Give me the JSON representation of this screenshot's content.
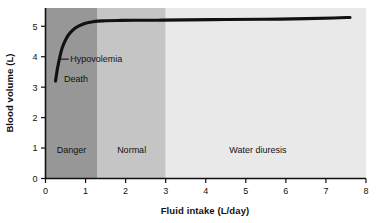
{
  "chart_data": {
    "type": "line",
    "title": "",
    "xlabel": "Fluid intake (L/day)",
    "ylabel": "Blood volume (L)",
    "xlim": [
      0,
      8
    ],
    "ylim": [
      0,
      5.6
    ],
    "grid": false,
    "legend": "none",
    "xticks": [
      "0",
      "1",
      "2",
      "3",
      "4",
      "5",
      "6",
      "7",
      "8"
    ],
    "xtick_values": [
      0,
      1,
      2,
      3,
      4,
      5,
      6,
      7,
      8
    ],
    "yticks": [
      "0",
      "1",
      "2",
      "3",
      "4",
      "5"
    ],
    "ytick_values": [
      0,
      1,
      2,
      3,
      4,
      5
    ],
    "series": [
      {
        "name": "Blood volume",
        "color": "#111111",
        "x": [
          0.25,
          0.3,
          0.36,
          0.42,
          0.5,
          0.6,
          0.72,
          0.85,
          1.0,
          1.15,
          1.3,
          1.5,
          1.8,
          2.2,
          2.8,
          3.5,
          4.5,
          5.5,
          6.5,
          7.2,
          7.6
        ],
        "y": [
          3.2,
          3.62,
          4.0,
          4.3,
          4.55,
          4.76,
          4.92,
          5.02,
          5.1,
          5.14,
          5.17,
          5.18,
          5.19,
          5.2,
          5.2,
          5.21,
          5.22,
          5.23,
          5.25,
          5.27,
          5.29
        ]
      }
    ],
    "bands": [
      {
        "label": "Danger",
        "x_start": 0.0,
        "x_end": 1.3,
        "color": "#979797",
        "label_x": 0.65,
        "label_y": 0.85
      },
      {
        "label": "Normal",
        "x_start": 1.3,
        "x_end": 3.0,
        "color": "#c5c5c5",
        "label_x": 2.15,
        "label_y": 0.85
      },
      {
        "label": "Water diuresis",
        "x_start": 3.0,
        "x_end": 8.0,
        "color": "#e9e9e9",
        "label_x": 5.3,
        "label_y": 0.85
      }
    ],
    "annotations": [
      {
        "label": "Hypovolemia",
        "x": 0.62,
        "y": 3.92,
        "leader_from_x": 0.38,
        "leader_from_y": 3.92,
        "leader_to_x": 0.58,
        "leader_to_y": 3.92
      },
      {
        "label": "Death",
        "x": 0.46,
        "y": 3.26,
        "leader_from_x": null,
        "leader_from_y": null,
        "leader_to_x": null,
        "leader_to_y": null
      }
    ]
  }
}
